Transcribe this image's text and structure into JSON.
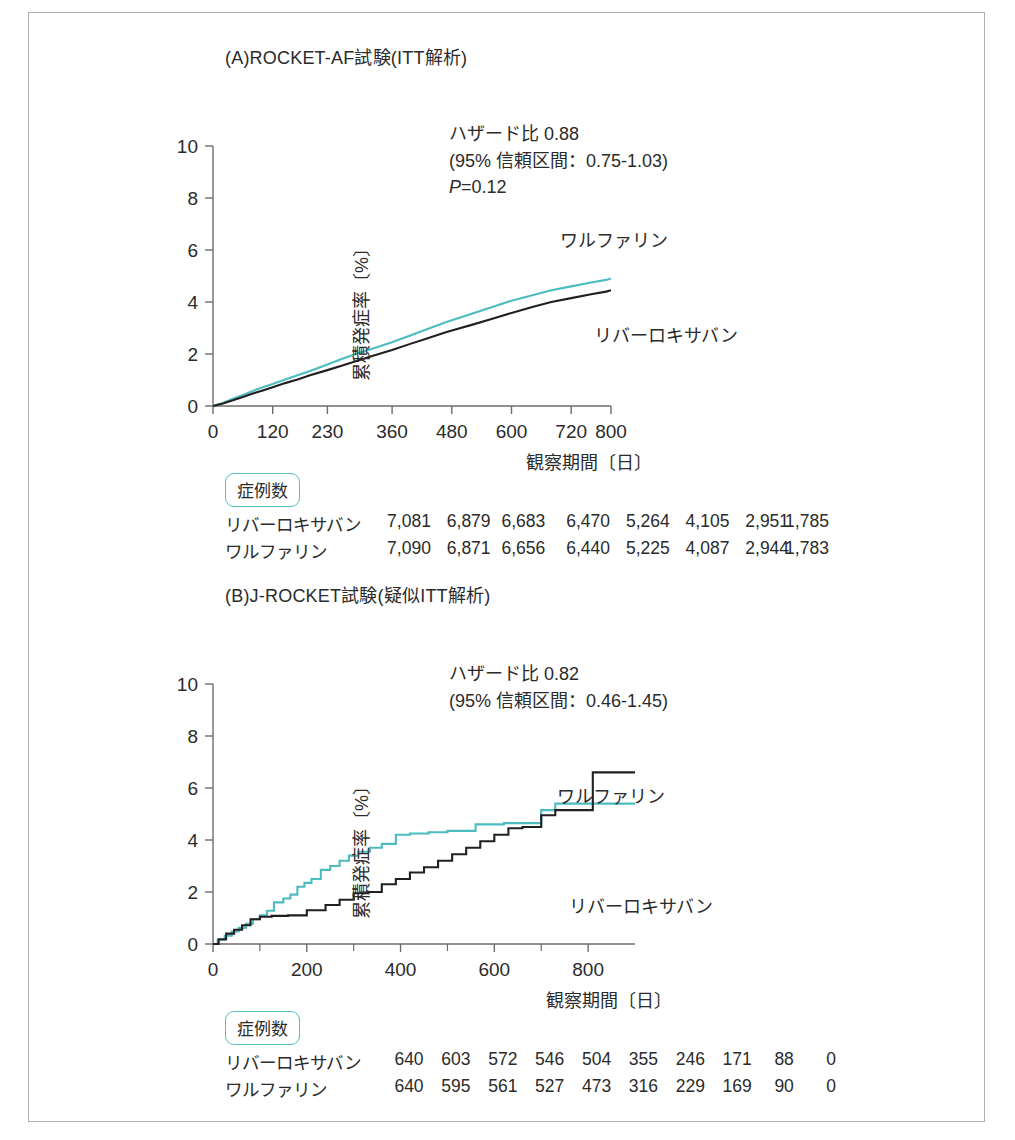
{
  "figure": {
    "background": "#ffffff",
    "border_color": "#b0b0b0",
    "colors": {
      "warfarin": "#4bbcc0",
      "rivaroxaban": "#231f20",
      "axis": "#6d6d6d",
      "badge_border": "#59bec2",
      "text": "#2b2b2b"
    }
  },
  "panels": [
    {
      "id": "a",
      "title": "(A)ROCKET-AF試験(ITT解析)",
      "stats": {
        "hazard_ratio": "ハザード比 0.88",
        "confidence_interval": "(95% 信頼区間：0.75-1.03)",
        "p_value_italic": "P",
        "p_value_eq": "=",
        "p_value_num": "0.12"
      },
      "axes": {
        "ylabel": "累積発症率〔%〕",
        "xlabel": "観察期間〔日〕",
        "yticks": [
          "0",
          "2",
          "4",
          "6",
          "8",
          "10"
        ],
        "ylim": [
          0,
          10
        ],
        "xticks": [
          "0",
          "120",
          "230",
          "360",
          "480",
          "600",
          "720",
          "800"
        ],
        "xlim": [
          0,
          800
        ]
      },
      "series_labels": {
        "warfarin": "ワルファリン",
        "rivaroxaban": "リバーロキサバン"
      },
      "risk_table": {
        "badge": "症例数",
        "rows": [
          {
            "name": "リバーロキサバン",
            "values": [
              "7,081",
              "6,879",
              "6,683",
              "6,470",
              "5,264",
              "4,105",
              "2,951",
              "1,785"
            ]
          },
          {
            "name": "ワルファリン",
            "values": [
              "7,090",
              "6,871",
              "6,656",
              "6,440",
              "5,225",
              "4,087",
              "2,944",
              "1,783"
            ]
          }
        ]
      }
    },
    {
      "id": "b",
      "title": "(B)J-ROCKET試験(疑似ITT解析)",
      "stats": {
        "hazard_ratio": "ハザード比 0.82",
        "confidence_interval": "(95% 信頼区間：0.46-1.45)"
      },
      "axes": {
        "ylabel": "累積発症率〔%〕",
        "xlabel": "観察期間〔日〕",
        "yticks": [
          "0",
          "2",
          "4",
          "6",
          "8",
          "10"
        ],
        "ylim": [
          0,
          10
        ],
        "xticks": [
          "0",
          "200",
          "400",
          "600",
          "800"
        ],
        "xlim": [
          0,
          900
        ]
      },
      "series_labels": {
        "warfarin": "ワルファリン",
        "rivaroxaban": "リバーロキサバン"
      },
      "risk_table": {
        "badge": "症例数",
        "rows": [
          {
            "name": "リバーロキサバン",
            "values": [
              "640",
              "603",
              "572",
              "546",
              "504",
              "355",
              "246",
              "171",
              "88",
              "0"
            ]
          },
          {
            "name": "ワルファリン",
            "values": [
              "640",
              "595",
              "561",
              "527",
              "473",
              "316",
              "229",
              "169",
              "90",
              "0"
            ]
          }
        ]
      }
    }
  ],
  "chart_data": [
    {
      "type": "line",
      "title": "(A)ROCKET-AF試験(ITT解析)",
      "xlabel": "観察期間〔日〕",
      "ylabel": "累積発症率〔%〕",
      "xlim": [
        0,
        800
      ],
      "ylim": [
        0,
        10
      ],
      "grid": false,
      "legend": "inline-annotations",
      "annotations": [
        "ハザード比 0.88",
        "(95% 信頼区間：0.75-1.03)",
        "P=0.12"
      ],
      "xticks": [
        0,
        120,
        230,
        360,
        480,
        600,
        720,
        800
      ],
      "yticks": [
        0,
        2,
        4,
        6,
        8,
        10
      ],
      "series": [
        {
          "name": "ワルファリン",
          "color": "#4bbcc0",
          "x": [
            0,
            20,
            40,
            60,
            80,
            100,
            120,
            145,
            170,
            195,
            230,
            260,
            290,
            320,
            360,
            395,
            430,
            465,
            480,
            520,
            560,
            600,
            640,
            680,
            720,
            760,
            790,
            800
          ],
          "y": [
            0,
            0.12,
            0.28,
            0.42,
            0.58,
            0.72,
            0.85,
            1.02,
            1.18,
            1.35,
            1.6,
            1.82,
            2.02,
            2.2,
            2.45,
            2.7,
            2.95,
            3.2,
            3.3,
            3.55,
            3.8,
            4.05,
            4.25,
            4.45,
            4.6,
            4.75,
            4.85,
            4.9
          ]
        },
        {
          "name": "リバーロキサバン",
          "color": "#231f20",
          "x": [
            0,
            20,
            40,
            60,
            80,
            100,
            120,
            145,
            170,
            195,
            230,
            260,
            290,
            320,
            360,
            395,
            430,
            465,
            480,
            520,
            560,
            600,
            640,
            680,
            720,
            760,
            790,
            800
          ],
          "y": [
            0,
            0.1,
            0.22,
            0.35,
            0.48,
            0.6,
            0.72,
            0.88,
            1.02,
            1.18,
            1.38,
            1.56,
            1.74,
            1.92,
            2.15,
            2.38,
            2.6,
            2.82,
            2.9,
            3.12,
            3.35,
            3.58,
            3.8,
            4.0,
            4.15,
            4.3,
            4.4,
            4.45
          ]
        }
      ],
      "risk_table": {
        "label": "症例数",
        "rows": [
          {
            "name": "リバーロキサバン",
            "values": [
              7081,
              6879,
              6683,
              6470,
              5264,
              4105,
              2951,
              1785
            ]
          },
          {
            "name": "ワルファリン",
            "values": [
              7090,
              6871,
              6656,
              6440,
              5225,
              4087,
              2944,
              1783
            ]
          }
        ]
      }
    },
    {
      "type": "line",
      "title": "(B)J-ROCKET試験(疑似ITT解析)",
      "xlabel": "観察期間〔日〕",
      "ylabel": "累積発症率〔%〕",
      "xlim": [
        0,
        900
      ],
      "ylim": [
        0,
        10
      ],
      "grid": false,
      "legend": "inline-annotations",
      "annotations": [
        "ハザード比 0.82",
        "(95% 信頼区間：0.46-1.45)"
      ],
      "xticks": [
        0,
        200,
        400,
        600,
        800
      ],
      "yticks": [
        0,
        2,
        4,
        6,
        8,
        10
      ],
      "step": "post",
      "series": [
        {
          "name": "ワルファリン",
          "color": "#4bbcc0",
          "x": [
            0,
            10,
            25,
            40,
            55,
            70,
            85,
            100,
            115,
            130,
            150,
            165,
            180,
            195,
            210,
            230,
            250,
            270,
            290,
            310,
            335,
            360,
            390,
            420,
            460,
            500,
            560,
            620,
            700,
            730,
            760,
            830,
            900
          ],
          "y": [
            0,
            0.16,
            0.32,
            0.48,
            0.62,
            0.78,
            0.95,
            1.1,
            1.28,
            1.6,
            1.75,
            1.9,
            2.2,
            2.35,
            2.5,
            2.85,
            3.0,
            3.2,
            3.4,
            3.55,
            3.7,
            3.85,
            4.2,
            4.25,
            4.3,
            4.35,
            4.6,
            4.65,
            5.15,
            5.4,
            5.4,
            5.4,
            5.4
          ]
        },
        {
          "name": "リバーロキサバン",
          "color": "#231f20",
          "x": [
            0,
            12,
            28,
            45,
            62,
            80,
            100,
            125,
            160,
            200,
            240,
            270,
            300,
            330,
            360,
            390,
            420,
            450,
            480,
            510,
            540,
            570,
            600,
            630,
            660,
            700,
            730,
            760,
            810,
            840,
            900
          ],
          "y": [
            0,
            0.18,
            0.4,
            0.55,
            0.72,
            0.95,
            1.05,
            1.08,
            1.1,
            1.3,
            1.5,
            1.7,
            1.95,
            2.0,
            2.3,
            2.5,
            2.75,
            2.95,
            3.2,
            3.45,
            3.7,
            3.95,
            4.2,
            4.45,
            4.5,
            4.95,
            5.15,
            5.15,
            6.6,
            6.6,
            6.6
          ]
        }
      ],
      "risk_table": {
        "label": "症例数",
        "rows": [
          {
            "name": "リバーロキサバン",
            "values": [
              640,
              603,
              572,
              546,
              504,
              355,
              246,
              171,
              88,
              0
            ]
          },
          {
            "name": "ワルファリン",
            "values": [
              640,
              595,
              561,
              527,
              473,
              316,
              229,
              169,
              90,
              0
            ]
          }
        ]
      }
    }
  ]
}
